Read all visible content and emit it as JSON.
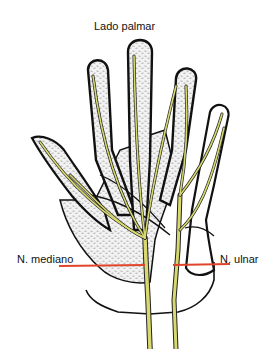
{
  "diagram": {
    "title": "Lado palmar",
    "labels": {
      "median_nerve": "N. mediano",
      "ulnar_nerve": "N. ulnar"
    },
    "colors": {
      "nerve": "#d8d870",
      "outline": "#111111",
      "stipple": "#bdbdbd",
      "section_line": "#e0442a",
      "background": "#ffffff"
    }
  }
}
